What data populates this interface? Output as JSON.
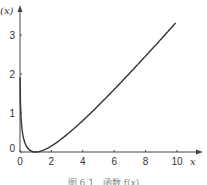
{
  "chart_data": {
    "type": "line",
    "title": "",
    "xlabel": "x",
    "ylabel": "(x)",
    "xlim": [
      0,
      10.5
    ],
    "ylim": [
      0,
      3.7
    ],
    "x_ticks": [
      "0",
      "2",
      "4",
      "6",
      "8",
      "10"
    ],
    "y_ticks": [
      "0",
      "1",
      "2",
      "3"
    ],
    "grid": false,
    "legend": null,
    "series": [
      {
        "name": "curve",
        "x": [
          0.02,
          0.05,
          0.1,
          0.2,
          0.3,
          0.5,
          0.7,
          1.0,
          1.5,
          2,
          3,
          4,
          5,
          6,
          7,
          8,
          9,
          10
        ],
        "y": [
          2.2,
          1.0,
          0.7,
          0.4,
          0.25,
          0.1,
          0.03,
          0.0,
          0.05,
          0.15,
          0.45,
          0.8,
          1.2,
          1.6,
          2.0,
          2.4,
          2.9,
          3.35
        ]
      }
    ],
    "caption": "图 6.1　函数 f(x)"
  }
}
